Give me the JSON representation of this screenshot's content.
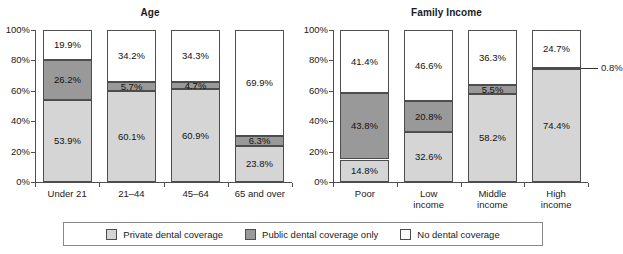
{
  "chart_data": [
    {
      "type": "bar",
      "subtype": "stacked-100-percent",
      "title": "Age",
      "xlabel": "",
      "ylabel": "",
      "ylim": [
        0,
        100
      ],
      "yticks": [
        "0%",
        "20%",
        "40%",
        "60%",
        "80%",
        "100%"
      ],
      "ytick_values": [
        0,
        20,
        40,
        60,
        80,
        100
      ],
      "grid": false,
      "categories": [
        "Under 21",
        "21–44",
        "45–64",
        "65 and over"
      ],
      "series": [
        {
          "name": "Private dental coverage",
          "values": [
            53.9,
            60.1,
            60.9,
            23.8
          ]
        },
        {
          "name": "Public dental coverage only",
          "values": [
            26.2,
            5.7,
            4.7,
            6.3
          ]
        },
        {
          "name": "No dental coverage",
          "values": [
            19.9,
            34.2,
            34.3,
            69.9
          ]
        }
      ],
      "data_labels": [
        [
          "53.9%",
          "26.2%",
          "19.9%"
        ],
        [
          "60.1%",
          "5.7%",
          "34.2%"
        ],
        [
          "60.9%",
          "4.7%",
          "34.3%"
        ],
        [
          "23.8%",
          "6.3%",
          "69.9%"
        ]
      ]
    },
    {
      "type": "bar",
      "subtype": "stacked-100-percent",
      "title": "Family Income",
      "xlabel": "",
      "ylabel": "",
      "ylim": [
        0,
        100
      ],
      "yticks": [
        "0%",
        "20%",
        "40%",
        "60%",
        "80%",
        "100%"
      ],
      "ytick_values": [
        0,
        20,
        40,
        60,
        80,
        100
      ],
      "grid": false,
      "categories": [
        "Poor",
        "Low income",
        "Middle income",
        "High income"
      ],
      "series": [
        {
          "name": "Private dental coverage",
          "values": [
            14.8,
            32.6,
            58.2,
            74.4
          ]
        },
        {
          "name": "Public dental coverage only",
          "values": [
            43.8,
            20.8,
            5.5,
            0.8
          ]
        },
        {
          "name": "No dental coverage",
          "values": [
            41.4,
            46.6,
            36.3,
            24.7
          ]
        }
      ],
      "data_labels": [
        [
          "14.8%",
          "43.8%",
          "41.4%"
        ],
        [
          "32.6%",
          "20.8%",
          "46.6%"
        ],
        [
          "58.2%",
          "5.5%",
          "36.3%"
        ],
        [
          "74.4%",
          "0.8%",
          "24.7%"
        ]
      ],
      "annotations": [
        {
          "text": "0.8%",
          "points_to": {
            "category": "High income",
            "series": "Public dental coverage only"
          }
        }
      ]
    }
  ],
  "panels": {
    "age": {
      "title": "Age",
      "yticks": [
        "100%",
        "80%",
        "60%",
        "40%",
        "20%",
        "0%"
      ],
      "categories": [
        "Under 21",
        "21–44",
        "45–64",
        "65 and over"
      ],
      "bars": [
        {
          "category": "Under 21",
          "none": "19.9%",
          "public": "26.2%",
          "private": "53.9%"
        },
        {
          "category": "21–44",
          "none": "34.2%",
          "public": "5.7%",
          "private": "60.1%"
        },
        {
          "category": "45–64",
          "none": "34.3%",
          "public": "4.7%",
          "private": "60.9%"
        },
        {
          "category": "65 and over",
          "none": "69.9%",
          "public": "6.3%",
          "private": "23.8%"
        }
      ]
    },
    "income": {
      "title": "Family Income",
      "yticks": [
        "100%",
        "80%",
        "60%",
        "40%",
        "20%",
        "0%"
      ],
      "categories": [
        "Poor",
        "Low income",
        "Middle income",
        "High income"
      ],
      "bars": [
        {
          "category": "Poor",
          "none": "41.4%",
          "public": "43.8%",
          "private": "14.8%"
        },
        {
          "category": "Low income",
          "none": "46.6%",
          "public": "20.8%",
          "private": "32.6%"
        },
        {
          "category": "Middle income",
          "none": "36.3%",
          "public": "5.5%",
          "private": "58.2%"
        },
        {
          "category": "High income",
          "none": "24.7%",
          "public": "0.8%",
          "private": "74.4%"
        }
      ],
      "callout": "0.8%"
    }
  },
  "legend": {
    "position": "bottom",
    "items": [
      {
        "key": "private",
        "label": "Private dental coverage",
        "color": "#d5d5d5"
      },
      {
        "key": "public",
        "label": "Public dental coverage only",
        "color": "#999999"
      },
      {
        "key": "none",
        "label": "No dental coverage",
        "color": "#ffffff"
      }
    ]
  }
}
